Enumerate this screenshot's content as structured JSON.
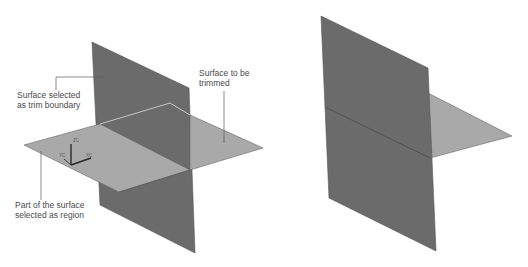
{
  "figure_left": {
    "title": "Before trim",
    "annotations": [
      {
        "id": "trim-boundary",
        "text": "Surface selected\nas trim boundary"
      },
      {
        "id": "surface-to-trim",
        "text": "Surface to be\ntrimmed"
      },
      {
        "id": "region",
        "text": "Part of the surface\nselected as region"
      }
    ],
    "triad": {
      "z": "ZC",
      "x": "XC",
      "y": "YC"
    }
  },
  "figure_right": {
    "title": "After trim"
  },
  "colors": {
    "background": "#ffffff",
    "dark_plane": "#6b6b6b",
    "light_plane": "#a9a9a9",
    "plane_edge": "#4d4d4d",
    "highlight_edge": "#c8c8c8",
    "leader_line": "#5a5a5a",
    "text": "#4a4a4a"
  }
}
